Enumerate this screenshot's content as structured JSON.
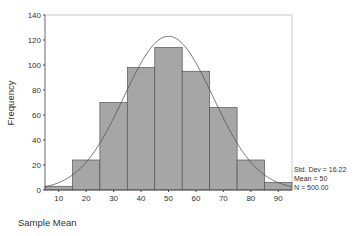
{
  "chart_data": {
    "type": "bar",
    "subtype": "histogram",
    "title": "",
    "xlabel": "Sample Mean",
    "ylabel": "Frequency",
    "bin_edges": [
      5,
      15,
      25,
      35,
      45,
      55,
      65,
      75,
      85,
      95
    ],
    "categories": [
      "10",
      "20",
      "30",
      "40",
      "50",
      "60",
      "70",
      "80",
      "90"
    ],
    "values": [
      3,
      24,
      70,
      98,
      114,
      95,
      66,
      24,
      6
    ],
    "xlim": [
      5,
      95
    ],
    "ylim": [
      0,
      140
    ],
    "x_ticks": [
      10,
      20,
      30,
      40,
      50,
      60,
      70,
      80,
      90
    ],
    "y_ticks": [
      0,
      20,
      40,
      60,
      80,
      100,
      120,
      140
    ],
    "grid": false,
    "overlay": {
      "type": "normal-curve",
      "mean": 50,
      "std_dev": 16.22,
      "n": 500
    },
    "legend": {
      "position": "right",
      "lines": [
        "Std. Dev = 16.22",
        "Mean = 50",
        "N = 500.00"
      ]
    },
    "colors": {
      "bar_fill": "#a6a6a6",
      "bar_stroke": "#555555",
      "curve": "#555555",
      "frame": "#c8c8c8"
    }
  }
}
